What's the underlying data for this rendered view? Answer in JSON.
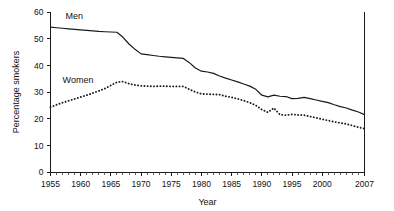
{
  "chart_data": {
    "type": "line",
    "title": "",
    "xlabel": "Year",
    "ylabel": "Percentage smokers",
    "xlim": [
      1955,
      2007
    ],
    "ylim": [
      0,
      60
    ],
    "yticks": [
      0,
      10,
      20,
      30,
      40,
      50,
      60
    ],
    "ytick_labels": [
      "0",
      "10",
      "20",
      "30",
      "40",
      "50",
      "60"
    ],
    "xticks": [
      1955,
      1960,
      1965,
      1970,
      1975,
      1980,
      1985,
      1990,
      1995,
      2000,
      2007
    ],
    "xtick_labels": [
      "1955",
      "1960",
      "1965",
      "1970",
      "1975",
      "1980",
      "1985",
      "1990",
      "1995",
      "2000",
      "2007"
    ],
    "x_minor_tick_step": 1,
    "grid": false,
    "legend_position": "inline-annotation",
    "line_color": "#1a1a1a",
    "background_color": "#ffffff",
    "x": [
      1955,
      1956,
      1957,
      1958,
      1959,
      1960,
      1961,
      1962,
      1963,
      1964,
      1965,
      1966,
      1967,
      1968,
      1969,
      1970,
      1971,
      1972,
      1973,
      1974,
      1975,
      1976,
      1977,
      1978,
      1979,
      1980,
      1981,
      1982,
      1983,
      1984,
      1985,
      1986,
      1987,
      1988,
      1989,
      1990,
      1991,
      1992,
      1993,
      1994,
      1995,
      1996,
      1997,
      1998,
      1999,
      2000,
      2001,
      2002,
      2003,
      2004,
      2005,
      2006,
      2007
    ],
    "series": [
      {
        "name": "Men",
        "style": "solid",
        "label": "Men",
        "label_x": 1957.5,
        "label_y": 57.5,
        "values": [
          54.3,
          54.1,
          53.9,
          53.7,
          53.5,
          53.3,
          53.1,
          52.9,
          52.7,
          52.6,
          52.5,
          52.4,
          50.5,
          48.0,
          46.0,
          44.3,
          44.0,
          43.7,
          43.4,
          43.2,
          43.0,
          42.8,
          42.6,
          41.0,
          39.0,
          37.8,
          37.5,
          37.0,
          36.0,
          35.2,
          34.5,
          33.8,
          33.0,
          32.2,
          31.0,
          28.8,
          28.2,
          28.8,
          28.4,
          28.3,
          27.5,
          27.6,
          28.0,
          27.5,
          27.0,
          26.5,
          26.0,
          25.2,
          24.5,
          24.0,
          23.2,
          22.5,
          21.5
        ]
      },
      {
        "name": "Women",
        "style": "dotted",
        "label": "Women",
        "label_x": 1957.0,
        "label_y": 33.5,
        "values": [
          24.3,
          25.2,
          26.0,
          26.7,
          27.4,
          28.1,
          28.8,
          29.6,
          30.4,
          31.3,
          32.5,
          33.7,
          33.9,
          33.1,
          32.6,
          32.3,
          32.2,
          32.1,
          32.2,
          32.2,
          32.1,
          32.1,
          32.1,
          31.0,
          30.0,
          29.3,
          29.2,
          29.1,
          29.0,
          28.4,
          28.0,
          27.4,
          26.8,
          26.0,
          25.0,
          23.4,
          22.4,
          24.0,
          21.5,
          21.3,
          21.6,
          21.4,
          21.3,
          20.8,
          20.3,
          19.8,
          19.3,
          18.8,
          18.4,
          18.0,
          17.4,
          16.8,
          16.2
        ]
      }
    ]
  }
}
